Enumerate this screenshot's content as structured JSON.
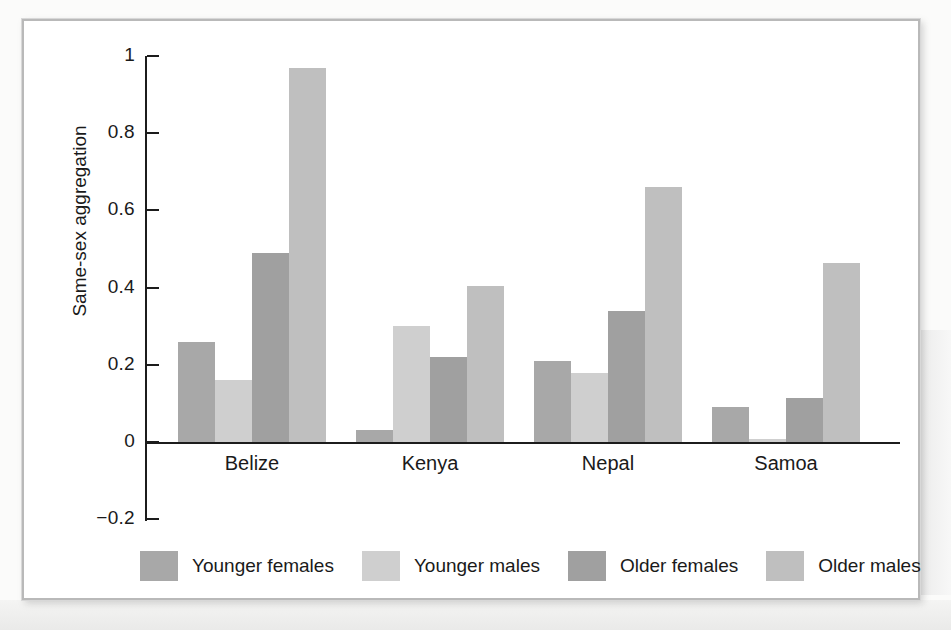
{
  "figure": {
    "background_color": "#ffffff",
    "frame_color": "#b9b9b9"
  },
  "chart_data": {
    "type": "bar",
    "title": "",
    "subtitle": "",
    "xlabel": "",
    "ylabel": "Same-sex aggregation",
    "categories": [
      "Belize",
      "Kenya",
      "Nepal",
      "Samoa"
    ],
    "ylim": [
      -0.2,
      1
    ],
    "yticks": [
      -0.2,
      0,
      0.2,
      0.4,
      0.6,
      0.8,
      1
    ],
    "ytick_labels": [
      "−0.2",
      "0",
      "0.2",
      "0.4",
      "0.6",
      "0.8",
      "1"
    ],
    "grid": false,
    "legend_position": "bottom",
    "series": [
      {
        "name": "Younger females",
        "color": "#a8a8a8",
        "values": [
          0.26,
          0.03,
          0.21,
          0.09
        ]
      },
      {
        "name": "Younger males",
        "color": "#cfcfcf",
        "values": [
          0.16,
          0.3,
          0.18,
          0.007
        ]
      },
      {
        "name": "Older females",
        "color": "#a0a0a0",
        "values": [
          0.49,
          0.22,
          0.34,
          0.115
        ]
      },
      {
        "name": "Older males",
        "color": "#bfbfbf",
        "values": [
          0.97,
          0.405,
          0.66,
          0.465
        ]
      }
    ]
  },
  "legend": {
    "items": [
      {
        "label": "Younger females",
        "color": "#a8a8a8"
      },
      {
        "label": "Younger males",
        "color": "#cfcfcf"
      },
      {
        "label": "Older females",
        "color": "#a0a0a0"
      },
      {
        "label": "Older males",
        "color": "#bfbfbf"
      }
    ]
  }
}
